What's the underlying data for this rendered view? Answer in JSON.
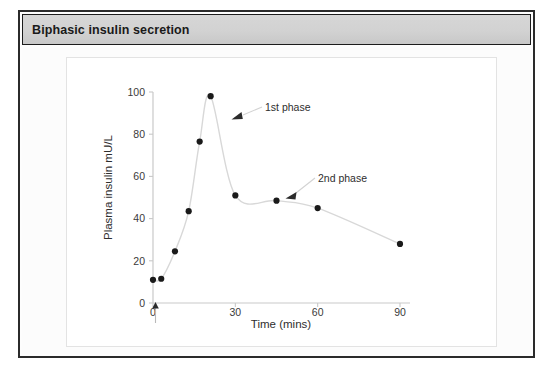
{
  "figure": {
    "title": "Biphasic insulin secretion"
  },
  "chart_data": {
    "type": "line",
    "title": "Biphasic insulin secretion",
    "xlabel": "Time (mins)",
    "ylabel": "Plasma insulin mU/L",
    "xlim": [
      0,
      95
    ],
    "ylim": [
      0,
      105
    ],
    "xticks": [
      0,
      30,
      60,
      90
    ],
    "xtick_labels": [
      "0",
      "30",
      "60",
      "90"
    ],
    "yticks": [
      0,
      20,
      40,
      60,
      80,
      100
    ],
    "ytick_labels": [
      "0",
      "20",
      "40",
      "60",
      "80",
      "100"
    ],
    "grid": false,
    "legend": false,
    "marker": "filled-circle",
    "line_color": "#d8d8d8",
    "marker_color": "#1a1a1a",
    "x": [
      0,
      3,
      8,
      13,
      17,
      21,
      30,
      45,
      60,
      90
    ],
    "y": [
      11,
      11.5,
      24.5,
      43.5,
      76.5,
      98,
      51,
      48.5,
      45,
      28
    ],
    "series": [
      {
        "name": "Plasma insulin",
        "values": [
          11,
          11.5,
          24.5,
          43.5,
          76.5,
          98,
          51,
          48.5,
          45,
          28
        ]
      }
    ],
    "annotations": [
      {
        "text": "1st phase",
        "x": 38,
        "y": 88,
        "arrow_x": 23,
        "arrow_y": 88
      },
      {
        "text": "2nd phase",
        "x": 60,
        "y": 63,
        "arrow_x": 46,
        "arrow_y": 51
      }
    ],
    "markers": [
      {
        "name": "glucose-injection-arrow",
        "x": 0,
        "y": 0,
        "glyph": "up-arrow"
      }
    ]
  }
}
